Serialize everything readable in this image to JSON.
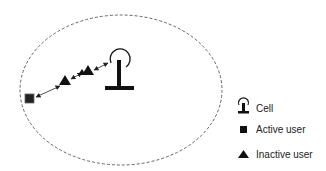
{
  "diagram": {
    "cell_boundary": {
      "style": "dashed",
      "color": "#555555"
    },
    "nodes": [
      {
        "id": "active-user",
        "type": "active_user",
        "shape": "square"
      },
      {
        "id": "relay-1",
        "type": "inactive_user",
        "shape": "triangle"
      },
      {
        "id": "relay-2",
        "type": "inactive_user",
        "shape": "triangle"
      },
      {
        "id": "base-station",
        "type": "cell",
        "shape": "antenna"
      }
    ],
    "links": [
      {
        "from": "active-user",
        "to": "relay-1",
        "bidirectional": true
      },
      {
        "from": "relay-1",
        "to": "relay-2",
        "bidirectional": true
      },
      {
        "from": "relay-2",
        "to": "base-station",
        "bidirectional": true
      }
    ]
  },
  "legend": {
    "items": [
      {
        "icon": "antenna-icon",
        "label": "Cell"
      },
      {
        "icon": "square-icon",
        "label": "Active user"
      },
      {
        "icon": "triangle-icon",
        "label": "Inactive user"
      }
    ]
  }
}
